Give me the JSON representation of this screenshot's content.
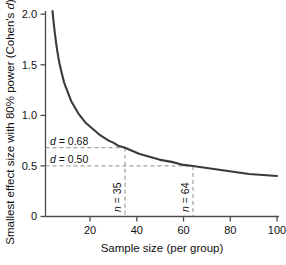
{
  "chart_data": {
    "type": "line",
    "title": "",
    "xlabel": "Sample size (per group)",
    "ylabel": "Smallest effect size with 80% power (Cohen's d)",
    "ylabel_plain": "Smallest effect size with 80% power (Cohen's ",
    "ylabel_italic": "d",
    "ylabel_tail": ")",
    "xlim": [
      0,
      104
    ],
    "ylim": [
      0,
      2.1
    ],
    "xticks": [
      20,
      40,
      60,
      80,
      100
    ],
    "xtick_labels": [
      "20",
      "40",
      "60",
      "80",
      "100"
    ],
    "yticks": [
      0,
      0.5,
      1.0,
      1.5,
      2.0
    ],
    "ytick_labels": [
      "0",
      "0.5",
      "1.0",
      "1.5",
      "2.0"
    ],
    "grid": false,
    "legend": "none",
    "series": [
      {
        "name": "Smallest detectable effect size at 80% power",
        "color": "#3a3a3a",
        "x": [
          4,
          4.5,
          5,
          5.5,
          6,
          6.5,
          7,
          7.5,
          8,
          9,
          10,
          11,
          12,
          13,
          14,
          15,
          16,
          17,
          18,
          19,
          20,
          22,
          24,
          26,
          28,
          30,
          32,
          35,
          38,
          41,
          44,
          47,
          50,
          55,
          60,
          64,
          70,
          76,
          82,
          88,
          94,
          100
        ],
        "y": [
          2.03,
          1.91,
          1.81,
          1.72,
          1.64,
          1.57,
          1.51,
          1.46,
          1.41,
          1.32,
          1.26,
          1.2,
          1.14,
          1.1,
          1.06,
          1.02,
          0.99,
          0.96,
          0.93,
          0.91,
          0.89,
          0.85,
          0.81,
          0.78,
          0.75,
          0.73,
          0.7,
          0.68,
          0.65,
          0.62,
          0.6,
          0.58,
          0.56,
          0.54,
          0.51,
          0.5,
          0.48,
          0.46,
          0.44,
          0.42,
          0.41,
          0.4
        ]
      }
    ],
    "annotations": [
      {
        "name": "effect-size-upper",
        "label_plain": "d",
        "label_value": " = 0.68",
        "type": "hline",
        "y": 0.68,
        "x_end": 35,
        "value": 0.68
      },
      {
        "name": "effect-size-lower",
        "label_plain": "d",
        "label_value": " = 0.50",
        "type": "hline",
        "y": 0.5,
        "x_end": 64,
        "value": 0.5
      },
      {
        "name": "sample-size-small",
        "label_plain": "n",
        "label_value": " = 35",
        "type": "vline",
        "x": 35,
        "y_top": 0.68,
        "value": 35
      },
      {
        "name": "sample-size-large",
        "label_plain": "n",
        "label_value": " = 64",
        "type": "vline",
        "x": 64,
        "y_top": 0.5,
        "value": 64
      }
    ],
    "colors": {
      "curve": "#3a3a3a",
      "axis": "#4d4d4d",
      "annotation_dash": "#8c8c8c",
      "text": "#111111",
      "background": "#ffffff"
    }
  }
}
